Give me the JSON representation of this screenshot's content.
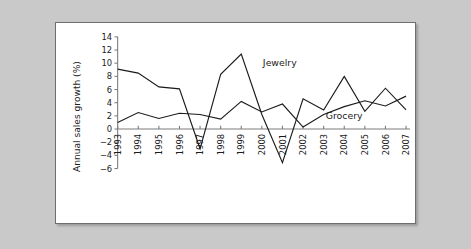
{
  "figure": {
    "background_color": "#c9c9c9",
    "panel_color": "#ffffff",
    "border_color": "#6e6e6e"
  },
  "chart_data": {
    "type": "line",
    "title": "",
    "xlabel": "",
    "ylabel": "Annual sales growth (%)",
    "grid": false,
    "legend_position": "inline-annotation",
    "categories": [
      "1993",
      "1994",
      "1995",
      "1996",
      "1997",
      "1998",
      "1999",
      "2000",
      "2001",
      "2002",
      "2003",
      "2004",
      "2005",
      "2006",
      "2007"
    ],
    "x": [
      1993,
      1994,
      1995,
      1996,
      1997,
      1998,
      1999,
      2000,
      2001,
      2002,
      2003,
      2004,
      2005,
      2006,
      2007
    ],
    "xlim": [
      1993,
      2007
    ],
    "ylim": [
      -6,
      14
    ],
    "yticks": [
      -6,
      -4,
      -2,
      0,
      2,
      4,
      6,
      8,
      10,
      12,
      14
    ],
    "ytick_labels": [
      "−6",
      "−4",
      "−2",
      "0",
      "2",
      "4",
      "6",
      "8",
      "10",
      "12",
      "14"
    ],
    "zero_line": 0,
    "series": [
      {
        "name": "Jewelry",
        "color": "#1b1b1b",
        "label_x": 2000.05,
        "label_y": 9.6,
        "values": [
          9.1,
          8.5,
          6.4,
          6.1,
          -3.0,
          8.3,
          11.4,
          2.2,
          -5.1,
          4.6,
          2.9,
          8.0,
          2.7,
          6.2,
          2.9
        ]
      },
      {
        "name": "Grocery",
        "color": "#1b1b1b",
        "label_x": 2003.1,
        "label_y": 1.55,
        "values": [
          1.0,
          2.5,
          1.6,
          2.4,
          2.2,
          1.5,
          4.2,
          2.6,
          3.8,
          0.3,
          2.2,
          3.4,
          4.3,
          3.5,
          5.0
        ]
      }
    ]
  }
}
